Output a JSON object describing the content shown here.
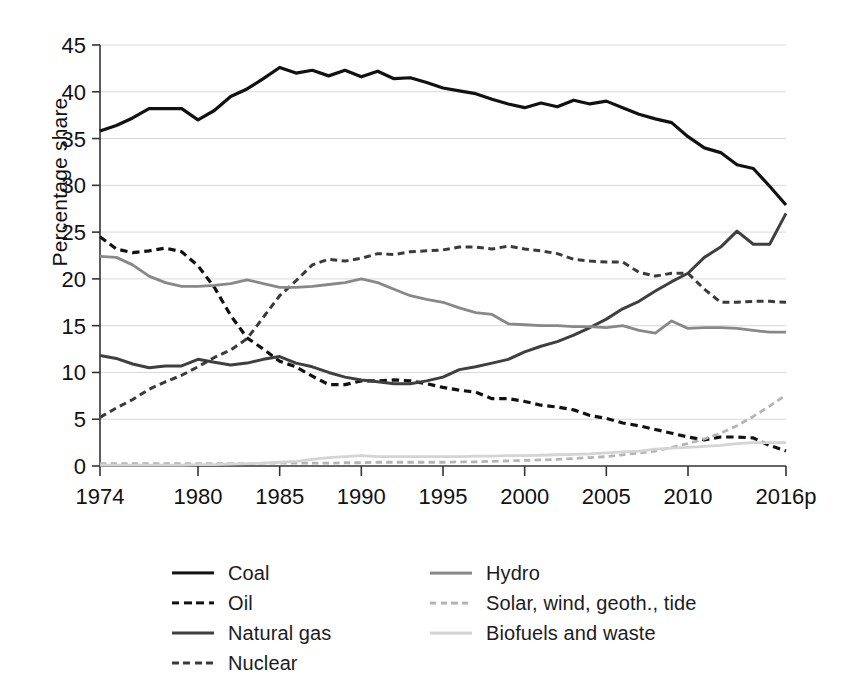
{
  "chart_data": {
    "type": "line",
    "title": "",
    "xlabel": "",
    "ylabel": "Percentage share",
    "xlim": [
      1974,
      2016
    ],
    "ylim": [
      0,
      45
    ],
    "ytick_step": 5,
    "grid": true,
    "legend_position": "below",
    "xtick_labels": [
      "1974",
      "1980",
      "1985",
      "1990",
      "1995",
      "2000",
      "2005",
      "2010",
      "2016p"
    ],
    "xtick_values": [
      1974,
      1980,
      1985,
      1990,
      1995,
      2000,
      2005,
      2010,
      2016
    ],
    "ytick_labels": [
      "0",
      "5",
      "10",
      "15",
      "20",
      "25",
      "30",
      "35",
      "40",
      "45"
    ],
    "ytick_values": [
      0,
      5,
      10,
      15,
      20,
      25,
      30,
      35,
      40,
      45
    ],
    "x": [
      1974,
      1975,
      1976,
      1977,
      1978,
      1979,
      1980,
      1981,
      1982,
      1983,
      1984,
      1985,
      1986,
      1987,
      1988,
      1989,
      1990,
      1991,
      1992,
      1993,
      1994,
      1995,
      1996,
      1997,
      1998,
      1999,
      2000,
      2001,
      2002,
      2003,
      2004,
      2005,
      2006,
      2007,
      2008,
      2009,
      2010,
      2011,
      2012,
      2013,
      2014,
      2015,
      2016
    ],
    "series": [
      {
        "name": "Coal",
        "color": "#111111",
        "style": "solid",
        "width": 3.2,
        "values": [
          35.8,
          36.4,
          37.2,
          38.2,
          38.2,
          38.2,
          37.0,
          38.0,
          39.5,
          40.3,
          41.4,
          42.6,
          42.0,
          42.3,
          41.7,
          42.3,
          41.6,
          42.2,
          41.4,
          41.5,
          41.0,
          40.4,
          40.1,
          39.8,
          39.2,
          38.7,
          38.3,
          38.8,
          38.4,
          39.1,
          38.7,
          39.0,
          38.3,
          37.6,
          37.1,
          36.7,
          35.2,
          34.0,
          33.5,
          32.2,
          31.8,
          29.9,
          27.9
        ]
      },
      {
        "name": "Oil",
        "color": "#111111",
        "style": "dashed",
        "width": 3.2,
        "values": [
          24.5,
          23.2,
          22.8,
          23.0,
          23.3,
          22.9,
          21.4,
          19.1,
          16.1,
          13.7,
          12.5,
          11.2,
          10.6,
          9.6,
          8.7,
          8.7,
          9.1,
          9.1,
          9.2,
          9.1,
          8.8,
          8.4,
          8.1,
          7.9,
          7.2,
          7.2,
          6.9,
          6.5,
          6.3,
          6.0,
          5.4,
          5.1,
          4.6,
          4.3,
          3.9,
          3.5,
          3.1,
          2.8,
          3.1,
          3.1,
          3.0,
          2.2,
          1.6
        ]
      },
      {
        "name": "Natural gas",
        "color": "#3f3f3f",
        "style": "solid",
        "width": 3.0,
        "values": [
          11.8,
          11.5,
          10.9,
          10.5,
          10.7,
          10.7,
          11.4,
          11.1,
          10.8,
          11.0,
          11.4,
          11.7,
          11.0,
          10.6,
          10.0,
          9.5,
          9.2,
          9.0,
          8.8,
          8.8,
          9.1,
          9.5,
          10.3,
          10.6,
          11.0,
          11.4,
          12.2,
          12.8,
          13.3,
          14.0,
          14.8,
          15.7,
          16.8,
          17.6,
          18.7,
          19.7,
          20.6,
          22.3,
          23.4,
          25.1,
          23.7,
          23.7,
          27.0
        ]
      },
      {
        "name": "Nuclear",
        "color": "#3a3a3a",
        "style": "dashed",
        "width": 3.0,
        "values": [
          5.2,
          6.2,
          7.1,
          8.2,
          9.0,
          9.7,
          10.6,
          11.6,
          12.4,
          13.6,
          15.9,
          18.2,
          19.8,
          21.5,
          22.1,
          21.9,
          22.2,
          22.7,
          22.6,
          22.9,
          23.0,
          23.1,
          23.4,
          23.4,
          23.2,
          23.5,
          23.2,
          23.0,
          22.7,
          22.1,
          21.9,
          21.8,
          21.8,
          20.7,
          20.3,
          20.6,
          20.6,
          18.9,
          17.5,
          17.5,
          17.6,
          17.6,
          17.5
        ]
      },
      {
        "name": "Hydro",
        "color": "#888888",
        "style": "solid",
        "width": 2.8,
        "values": [
          22.4,
          22.3,
          21.5,
          20.3,
          19.6,
          19.2,
          19.2,
          19.3,
          19.5,
          19.9,
          19.5,
          19.1,
          19.1,
          19.2,
          19.4,
          19.6,
          20.0,
          19.6,
          18.9,
          18.2,
          17.8,
          17.5,
          16.9,
          16.4,
          16.2,
          15.2,
          15.1,
          15.0,
          15.0,
          14.9,
          14.9,
          14.8,
          15.0,
          14.5,
          14.2,
          15.5,
          14.7,
          14.8,
          14.8,
          14.7,
          14.5,
          14.3,
          14.3
        ]
      },
      {
        "name": "Solar, wind, geoth., tide",
        "color": "#b4b4b4",
        "style": "dashed",
        "width": 2.8,
        "values": [
          0.25,
          0.25,
          0.25,
          0.25,
          0.25,
          0.25,
          0.25,
          0.25,
          0.25,
          0.25,
          0.3,
          0.3,
          0.3,
          0.3,
          0.3,
          0.35,
          0.35,
          0.4,
          0.4,
          0.4,
          0.4,
          0.4,
          0.45,
          0.45,
          0.5,
          0.55,
          0.6,
          0.65,
          0.7,
          0.8,
          0.9,
          1.0,
          1.2,
          1.4,
          1.6,
          2.0,
          2.4,
          2.9,
          3.5,
          4.3,
          5.3,
          6.4,
          7.6
        ]
      },
      {
        "name": "Biofuels and waste",
        "color": "#d4d4d4",
        "style": "solid",
        "width": 2.8,
        "values": [
          0.1,
          0.1,
          0.1,
          0.1,
          0.1,
          0.1,
          0.15,
          0.15,
          0.2,
          0.25,
          0.3,
          0.4,
          0.5,
          0.7,
          0.9,
          1.0,
          1.1,
          1.0,
          1.0,
          1.0,
          1.0,
          1.0,
          1.0,
          1.05,
          1.05,
          1.1,
          1.1,
          1.15,
          1.2,
          1.25,
          1.3,
          1.4,
          1.5,
          1.6,
          1.8,
          1.9,
          2.0,
          2.1,
          2.2,
          2.4,
          2.5,
          2.5,
          2.5
        ]
      }
    ]
  },
  "axis": {
    "y_title": "Percentage share"
  },
  "legend": {
    "column_1": [
      {
        "label": "Coal",
        "style": "solid",
        "color": "#111111",
        "width": 3.2
      },
      {
        "label": "Oil",
        "style": "dashed",
        "color": "#111111",
        "width": 3.2
      },
      {
        "label": "Natural gas",
        "style": "solid",
        "color": "#3f3f3f",
        "width": 3.0
      },
      {
        "label": "Nuclear",
        "style": "dashed",
        "color": "#3a3a3a",
        "width": 3.0
      }
    ],
    "column_2": [
      {
        "label": "Hydro",
        "style": "solid",
        "color": "#888888",
        "width": 2.8
      },
      {
        "label": "Solar, wind, geoth., tide",
        "style": "dashed",
        "color": "#b4b4b4",
        "width": 2.8
      },
      {
        "label": "Biofuels and waste",
        "style": "solid",
        "color": "#d4d4d4",
        "width": 2.8
      }
    ]
  }
}
